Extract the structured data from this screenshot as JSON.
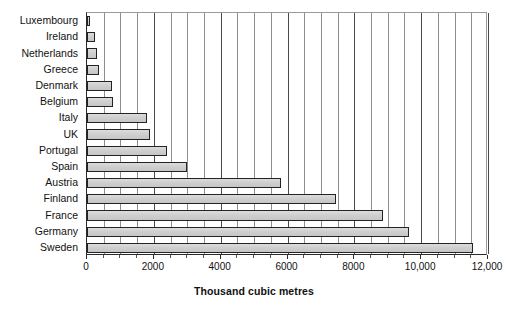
{
  "chart_data": {
    "type": "bar",
    "orientation": "horizontal",
    "title": "",
    "xlabel": "Thousand cubic metres",
    "ylabel": "",
    "xlim": [
      0,
      12000
    ],
    "grid": true,
    "legend": false,
    "x_major_ticks": [
      0,
      2000,
      4000,
      6000,
      8000,
      10000,
      12000
    ],
    "x_major_tick_labels": [
      "0",
      "2000",
      "4000",
      "6000",
      "8000",
      "10,000",
      "12,000"
    ],
    "x_minor_tick_step": 500,
    "categories": [
      "Luxembourg",
      "Ireland",
      "Netherlands",
      "Greece",
      "Denmark",
      "Belgium",
      "Italy",
      "UK",
      "Portugal",
      "Spain",
      "Austria",
      "Finland",
      "France",
      "Germany",
      "Sweden"
    ],
    "values": [
      90,
      250,
      300,
      350,
      750,
      780,
      1800,
      1880,
      2400,
      2980,
      5820,
      7450,
      8850,
      9650,
      11550
    ],
    "bar_fill_color": "#d0d0d0",
    "bar_edge_color": "#232323",
    "axis_color": "#2b2b2b",
    "grid_color": "#8d8d8d",
    "background_color": "#ffffff"
  }
}
